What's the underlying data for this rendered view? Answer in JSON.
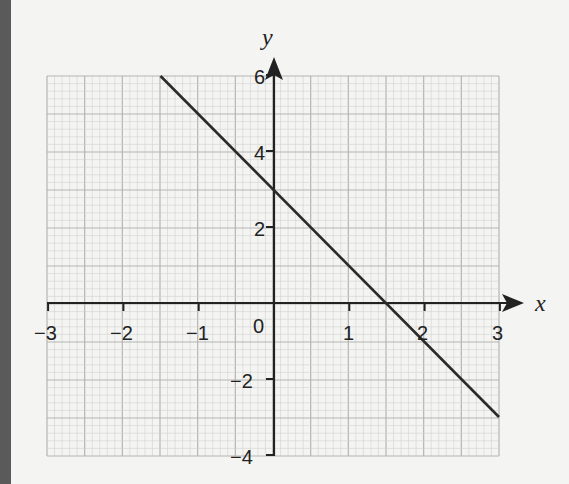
{
  "chart_data": {
    "type": "line",
    "title": "",
    "xlabel": "x",
    "ylabel": "y",
    "xlim": [
      -3,
      3
    ],
    "ylim": [
      -4,
      6
    ],
    "x_ticks": [
      "−3",
      "−2",
      "−1",
      "0",
      "1",
      "2",
      "3"
    ],
    "y_ticks": [
      "6",
      "4",
      "2",
      "−2",
      "−4"
    ],
    "grid": true,
    "series": [
      {
        "name": "y = 3 − 2x",
        "x": [
          -1.5,
          0,
          1.5,
          3
        ],
        "y": [
          6,
          3,
          0,
          -3
        ]
      }
    ]
  },
  "labels": {
    "x_axis": "x",
    "y_axis": "y",
    "origin": "0",
    "xt": {
      "m3": "−3",
      "m2": "−2",
      "m1": "−1",
      "p1": "1",
      "p2": "2",
      "p3": "3"
    },
    "yt": {
      "p6": "6",
      "p4": "4",
      "p2": "2",
      "m2": "−2",
      "m4": "−4"
    }
  },
  "colors": {
    "grid_minor": "#d2d2d2",
    "grid_major": "#b4b4b4",
    "ink": "#222222"
  }
}
